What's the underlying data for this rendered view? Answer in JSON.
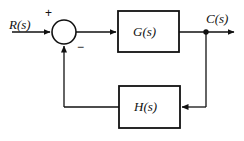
{
  "diagram": {
    "type": "control-system-block-diagram",
    "stroke_color": "#111111",
    "background_color": "#ffffff",
    "signals": {
      "input_label": "R(s)",
      "output_label": "C(s)"
    },
    "summing_junction": {
      "name": "summing-junction",
      "plus_sign": "+",
      "minus_sign": "−",
      "center_x": 64,
      "center_y": 32,
      "radius": 12
    },
    "blocks": [
      {
        "id": "forward-block",
        "label": "G(s)",
        "x": 118,
        "y": 11,
        "width": 61,
        "height": 41
      },
      {
        "id": "feedback-block",
        "label": "H(s)",
        "x": 119,
        "y": 86,
        "width": 61,
        "height": 42
      }
    ],
    "takeoff_point": {
      "name": "output-takeoff-node",
      "x": 206,
      "y": 32
    }
  }
}
